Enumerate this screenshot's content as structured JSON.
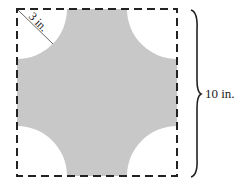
{
  "figure": {
    "square_side_label": "10 in.",
    "radius_label": "3 in.",
    "colors": {
      "shaded": "#c8c8c8",
      "border": "#222222"
    }
  }
}
